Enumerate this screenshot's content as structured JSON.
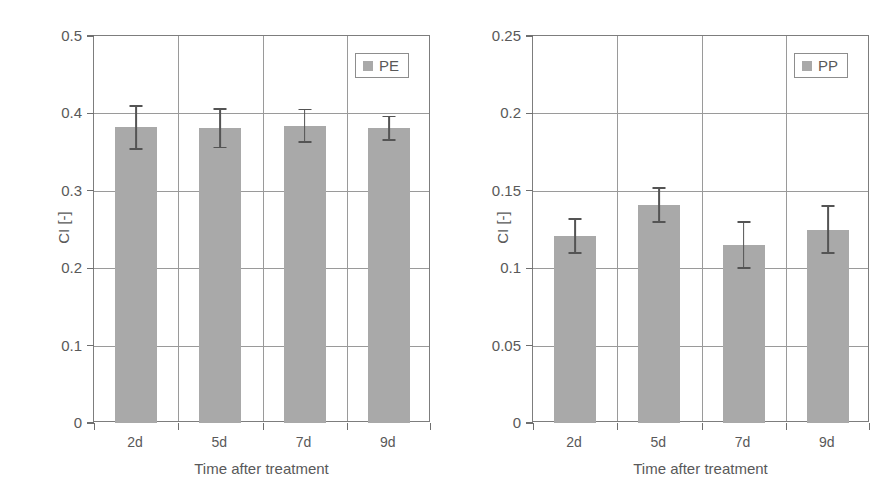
{
  "figure": {
    "panels": [
      "left",
      "right"
    ],
    "bar_color": "#a9a9a9",
    "error_color": "#545454",
    "axis_color": "#7d7d7d",
    "grid_color": "#9a9a9a",
    "background": "#ffffff"
  },
  "chart_data": [
    {
      "type": "bar",
      "title": "",
      "series_name": "PE",
      "legend": [
        "PE"
      ],
      "legend_position": "top-right",
      "categories": [
        "2d",
        "5d",
        "7d",
        "9d"
      ],
      "values": [
        0.382,
        0.381,
        0.384,
        0.381
      ],
      "errors": [
        0.028,
        0.025,
        0.021,
        0.015
      ],
      "error_upper": [
        0.41,
        0.406,
        0.405,
        0.396
      ],
      "error_lower": [
        0.354,
        0.356,
        0.363,
        0.366
      ],
      "xlabel": "Time after treatment",
      "ylabel": "CI  [-]",
      "ylim": [
        0,
        0.5
      ],
      "yticks": [
        0,
        0.1,
        0.2,
        0.3,
        0.4,
        0.5
      ],
      "ytick_labels": [
        "0",
        "0.1",
        "0.2",
        "0.3",
        "0.4",
        "0.5"
      ],
      "grid": "horizontal-and-vertical"
    },
    {
      "type": "bar",
      "title": "",
      "series_name": "PP",
      "legend": [
        "PP"
      ],
      "legend_position": "top-right",
      "categories": [
        "2d",
        "5d",
        "7d",
        "9d"
      ],
      "values": [
        0.121,
        0.141,
        0.115,
        0.125
      ],
      "errors": [
        0.011,
        0.011,
        0.015,
        0.015
      ],
      "error_upper": [
        0.132,
        0.152,
        0.13,
        0.14
      ],
      "error_lower": [
        0.11,
        0.13,
        0.1,
        0.11
      ],
      "xlabel": "Time after treatment",
      "ylabel": "CI  [-]",
      "ylim": [
        0,
        0.25
      ],
      "yticks": [
        0,
        0.05,
        0.1,
        0.15,
        0.2,
        0.25
      ],
      "ytick_labels": [
        "0",
        "0.05",
        "0.1",
        "0.15",
        "0.2",
        "0.25"
      ],
      "grid": "horizontal-and-vertical"
    }
  ]
}
